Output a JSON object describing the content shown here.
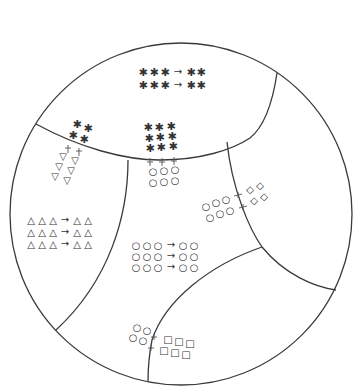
{
  "title_fragment": "",
  "diagram": {
    "outer_circle": {
      "cx": 181,
      "cy": 214,
      "r": 171
    },
    "stroke_color": "#3a3a3a",
    "regions": [
      {
        "name": "top-region",
        "symbol": "asterisk",
        "reaction_rows": [
          {
            "reactants": "✱ ✱ ✱",
            "arrow": "→",
            "products": "✱ ✱"
          },
          {
            "reactants": "✱ ✱ ✱",
            "arrow": "→",
            "products": "✱ ✱"
          }
        ]
      },
      {
        "name": "left-region",
        "symbol": "triangle",
        "reaction_rows": [
          {
            "reactants": "△ △ △",
            "arrow": "→",
            "products": "△ △"
          },
          {
            "reactants": "△ △ △",
            "arrow": "→",
            "products": "△ △"
          },
          {
            "reactants": "△ △ △",
            "arrow": "→",
            "products": "△ △"
          }
        ]
      },
      {
        "name": "center-region",
        "symbol": "circle",
        "reaction_rows": [
          {
            "reactants": "○ ○ ○",
            "arrow": "→",
            "products": "○ ○"
          },
          {
            "reactants": "○ ○ ○",
            "arrow": "→",
            "products": "○ ○"
          },
          {
            "reactants": "○ ○ ○",
            "arrow": "→",
            "products": "○ ○"
          }
        ]
      },
      {
        "name": "right-region",
        "symbol": "none"
      },
      {
        "name": "bottom-right-region",
        "symbol": "none"
      }
    ],
    "interfaces": [
      {
        "name": "asterisk-to-triangle",
        "from": "✱",
        "to": "▽"
      },
      {
        "name": "asterisk-to-circle",
        "from": "✱",
        "to": "○"
      },
      {
        "name": "circle-to-diamond",
        "from": "○",
        "to": "◇"
      },
      {
        "name": "circle-to-square",
        "from": "○",
        "to": "□"
      }
    ]
  }
}
